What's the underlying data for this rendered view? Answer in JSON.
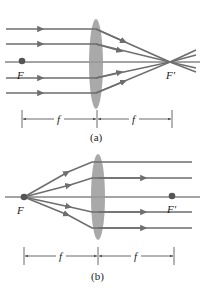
{
  "colors": {
    "ray": "#6e6e6e",
    "axis": "#333333",
    "lens": "#9a9a9a",
    "dot": "#555555",
    "dim": "#444444"
  },
  "diagrams": [
    {
      "id": "a",
      "caption": "(a)",
      "focal_near_label": "F",
      "focal_far_label": "F′",
      "dimension_labels": [
        "f",
        "f"
      ],
      "description": "Parallel rays converge to focal point F′"
    },
    {
      "id": "b",
      "caption": "(b)",
      "focal_near_label": "F",
      "focal_far_label": "F′",
      "dimension_labels": [
        "f",
        "f"
      ],
      "description": "Rays from focal point F emerge parallel"
    }
  ]
}
